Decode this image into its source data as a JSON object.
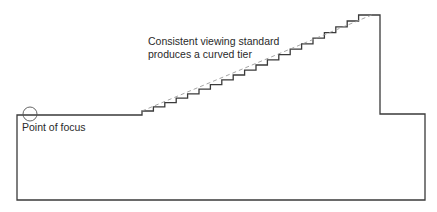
{
  "diagram": {
    "annotations": {
      "tier_label_line1": "Consistent viewing standard",
      "tier_label_line2": "produces a curved tier",
      "focus_label": "Point of focus"
    },
    "colors": {
      "outline": "#3a3a3a",
      "sightline": "#9a9a9a",
      "text": "#2a2a2a",
      "background": "#ffffff"
    },
    "geometry": {
      "floor_y": 115,
      "left_x": 17,
      "bottom_y": 200,
      "step_start_x": 142,
      "rear_wall_x": 380,
      "rear_wall_top_y": 15,
      "rear_ledge_y": 114,
      "right_x": 425,
      "step_count": 20,
      "focus_point": {
        "cx": 30,
        "cy": 114,
        "r": 7
      }
    }
  }
}
